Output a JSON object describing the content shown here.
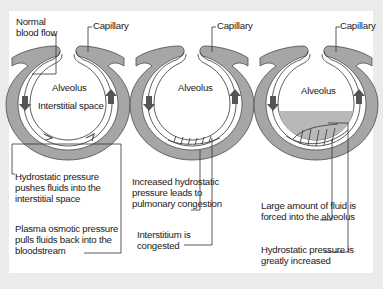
{
  "colors": {
    "background": "#ebebeb",
    "panel": "#ffffff",
    "capillary_fill": "#a6a6a6",
    "capillary_stroke": "#4a4a4a",
    "fluid": "#b8b8b8",
    "arrow": "#555555",
    "leader_line": "#333333"
  },
  "panels": [
    {
      "name": "normal",
      "labels": {
        "top_left": [
          "Normal",
          "blood flow"
        ],
        "capillary": "Capillary",
        "alveolus": "Alveolus",
        "interstitial": "Interstitial space",
        "note1": [
          "Hydrostatic pressure",
          "pushes fluids into the",
          "interstitial space"
        ],
        "note2": [
          "Plasma osmotic pressure",
          "pulls fluids back into the",
          "bloodstream"
        ]
      }
    },
    {
      "name": "congestion",
      "labels": {
        "capillary": "Capillary",
        "alveolus": "Alveolus",
        "note1": [
          "Increased hydrostatic",
          "pressure leads to",
          "pulmonary congestion"
        ],
        "note2": [
          "Interstitium is",
          "congested"
        ]
      }
    },
    {
      "name": "edema",
      "labels": {
        "capillary": "Capillary",
        "alveolus": "Alveolus",
        "note1": [
          "Large amount of fluid is",
          "forced into the alveolus"
        ],
        "note2": [
          "Hydrostatic pressure is",
          "greatly increased"
        ]
      }
    }
  ]
}
